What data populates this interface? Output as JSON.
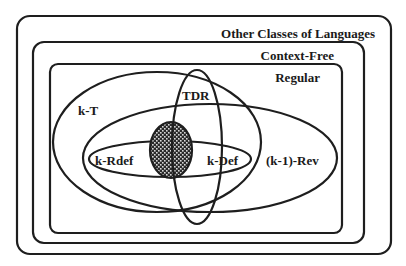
{
  "diagram": {
    "type": "nested-set-venn",
    "colors": {
      "stroke": "#1e1e1e",
      "text": "#1a1a1a",
      "background": "#ffffff",
      "hatch": "#2a2a2a"
    },
    "boxes": [
      {
        "id": "other",
        "label": "Other Classes of Languages"
      },
      {
        "id": "cf",
        "label": "Context-Free"
      },
      {
        "id": "regular",
        "label": "Regular"
      }
    ],
    "ellipses": [
      {
        "id": "kt",
        "label": "k-T"
      },
      {
        "id": "tdr",
        "label": "TDR"
      },
      {
        "id": "krev",
        "label": "(k-1)-Rev"
      },
      {
        "id": "krdef",
        "label": "k-Rdef"
      },
      {
        "id": "kdef",
        "label": "k-Def"
      }
    ],
    "intersection": {
      "id": "core",
      "pattern": "hatched"
    }
  }
}
